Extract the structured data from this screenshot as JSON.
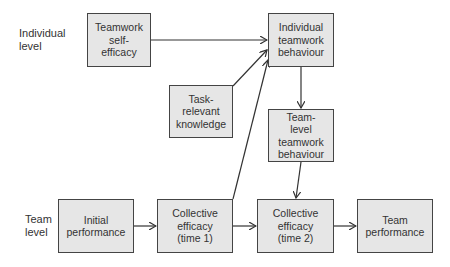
{
  "levels": {
    "individual": "Individual\nlevel",
    "team": "Team\nlevel"
  },
  "nodes": {
    "teamwork_self_efficacy": "Teamwork\nself-\nefficacy",
    "individual_teamwork_behaviour": "Individual\nteamwork\nbehaviour",
    "task_relevant_knowledge": "Task-\nrelevant\nknowledge",
    "team_level_teamwork_behaviour": "Team-\nlevel\nteamwork\nbehaviour",
    "initial_performance": "Initial\nperformance",
    "collective_efficacy_t1": "Collective\nefficacy\n(time 1)",
    "collective_efficacy_t2": "Collective\nefficacy\n(time 2)",
    "team_performance": "Team\nperformance"
  },
  "edges": [
    {
      "from": "Teamwork self-efficacy",
      "to": "Individual teamwork behaviour"
    },
    {
      "from": "Task-relevant knowledge",
      "to": "Individual teamwork behaviour"
    },
    {
      "from": "Collective efficacy (time 1)",
      "to": "Individual teamwork behaviour"
    },
    {
      "from": "Individual teamwork behaviour",
      "to": "Team-level teamwork behaviour"
    },
    {
      "from": "Team-level teamwork behaviour",
      "to": "Collective efficacy (time 2)"
    },
    {
      "from": "Initial performance",
      "to": "Collective efficacy (time 1)"
    },
    {
      "from": "Collective efficacy (time 1)",
      "to": "Collective efficacy (time 2)"
    },
    {
      "from": "Collective efficacy (time 2)",
      "to": "Team performance"
    }
  ]
}
